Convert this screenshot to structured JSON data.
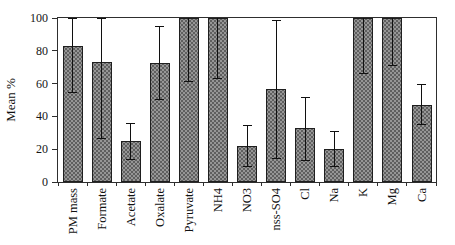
{
  "chart_data": {
    "type": "bar",
    "ylabel": "Mean %",
    "xlabel": "",
    "ylim": [
      0,
      100
    ],
    "yticks": [
      0,
      20,
      40,
      60,
      80,
      100
    ],
    "grid": false,
    "legend_position": "none",
    "categories": [
      "PM mass",
      "Formate",
      "Acetate",
      "Oxalate",
      "Pyruvate",
      "NH4",
      "NO3",
      "nss-SO4",
      "Cl",
      "Na",
      "K",
      "Mg",
      "Ca"
    ],
    "values": [
      83,
      73,
      25,
      72.5,
      100,
      100,
      22,
      56.5,
      33,
      20,
      100,
      100,
      47
    ],
    "error_low": [
      54,
      26,
      13.5,
      50,
      61,
      63,
      9,
      14,
      13,
      9,
      66,
      71,
      35
    ],
    "error_high": [
      100,
      100,
      36,
      95,
      100,
      100,
      35,
      99,
      52,
      31,
      100,
      100,
      60
    ],
    "error_high_capped": [
      true,
      true,
      true,
      true,
      false,
      false,
      true,
      true,
      true,
      true,
      false,
      false,
      true
    ],
    "colors": {
      "bar_fill": "#969696",
      "bar_stipple": "#5f5f5f",
      "bar_border": "#1f1f1f",
      "error_bar": "#101010",
      "axis": "#2e2e2e",
      "background": "#ffffff",
      "text": "#111111"
    }
  }
}
